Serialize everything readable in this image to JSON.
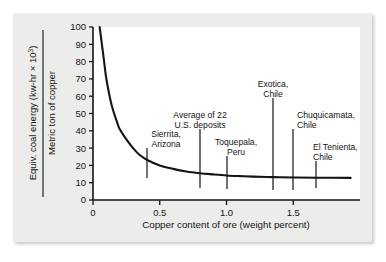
{
  "chart_data": {
    "type": "line",
    "title": "",
    "xlabel": "Copper content of ore (weight percent)",
    "ylabel_numerator": "Equiv. coal energy (kw-hr × 10",
    "ylabel_numerator_sup": "3",
    "ylabel_numerator_tail": ")",
    "ylabel_denominator": "Metric ton of copper",
    "xlim": [
      0,
      2.0
    ],
    "ylim": [
      0,
      100
    ],
    "xticks": [
      0,
      0.5,
      1.0,
      1.5
    ],
    "xtick_labels": [
      "0",
      "0.5",
      "1.0",
      "1.5"
    ],
    "yticks": [
      0,
      10,
      20,
      30,
      40,
      50,
      60,
      70,
      80,
      90,
      100
    ],
    "ytick_labels": [
      "0",
      "10",
      "20",
      "30",
      "40",
      "50",
      "60",
      "70",
      "80",
      "90",
      "100"
    ],
    "grid": false,
    "legend": "none",
    "curve_description": "Inverse (hyperbolic) decay of equivalent coal energy per metric ton of copper versus copper ore grade",
    "x": [
      0.05,
      0.08,
      0.1,
      0.13,
      0.15,
      0.18,
      0.2,
      0.25,
      0.3,
      0.35,
      0.41,
      0.5,
      0.6,
      0.7,
      0.8,
      0.9,
      1.0,
      1.1,
      1.2,
      1.35,
      1.5,
      1.68,
      1.93
    ],
    "y": [
      100,
      82,
      70,
      58,
      52,
      45,
      41,
      35,
      30,
      26,
      23,
      20,
      18,
      16.5,
      15.5,
      14.8,
      14.2,
      13.8,
      13.5,
      13.2,
      13.0,
      12.9,
      12.8
    ],
    "annotations": [
      {
        "name": "sierrita-arizona",
        "lines": [
          "Sierrita,",
          "Arizona"
        ],
        "x_value": 0.41,
        "y_value": 23,
        "label_anchor": "middle",
        "label_x_px": 166,
        "label_y_px": 137,
        "tick_x_px": 147,
        "tick_y_top_px": 148,
        "tick_y_bottom_px": 178
      },
      {
        "name": "average-of-22-us-deposits",
        "lines": [
          "Average of 22",
          "U.S. deposits"
        ],
        "x_value": 0.8,
        "y_value": 15.5,
        "label_anchor": "middle",
        "label_x_px": 200,
        "label_y_px": 118,
        "tick_x_px": 200,
        "tick_y_top_px": 129,
        "tick_y_bottom_px": 188
      },
      {
        "name": "toquepala-peru",
        "lines": [
          "Toquepala,",
          "Peru"
        ],
        "x_value": 1.0,
        "y_value": 14.2,
        "label_anchor": "middle",
        "label_x_px": 236,
        "label_y_px": 145,
        "tick_x_px": 227,
        "tick_y_top_px": 156,
        "tick_y_bottom_px": 189
      },
      {
        "name": "exotica-chile",
        "lines": [
          "Exotica,",
          "Chile"
        ],
        "x_value": 1.35,
        "y_value": 13.2,
        "label_anchor": "middle",
        "label_x_px": 273,
        "label_y_px": 87,
        "tick_x_px": 273,
        "tick_y_top_px": 98,
        "tick_y_bottom_px": 190
      },
      {
        "name": "chuquicamata-chile",
        "lines": [
          "Chuquicamata,",
          "Chile"
        ],
        "x_value": 1.5,
        "y_value": 13.0,
        "label_anchor": "start",
        "label_x_px": 297,
        "label_y_px": 118,
        "tick_x_px": 293,
        "tick_y_top_px": 129,
        "tick_y_bottom_px": 190
      },
      {
        "name": "el-tenienta-chile",
        "lines": [
          "El Tenienta,",
          "Chile"
        ],
        "x_value": 1.68,
        "y_value": 12.9,
        "label_anchor": "start",
        "label_x_px": 313,
        "label_y_px": 150,
        "tick_x_px": 316,
        "tick_y_top_px": 161,
        "tick_y_bottom_px": 188
      }
    ]
  },
  "colors": {
    "card_background": "#ececeb",
    "plot_background": "#ffffff",
    "axis": "#141414",
    "curve": "#141414",
    "text": "#141414"
  }
}
